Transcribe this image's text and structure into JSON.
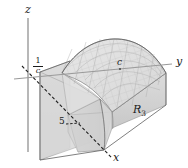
{
  "figure": {
    "type": "3d-math-diagram",
    "background_color": "#ffffff"
  },
  "axes": {
    "z_label": "z",
    "y_label": "y",
    "x_label": "x",
    "axis_color": "#8c8c8c",
    "dashed_axis_color": "#1a1a1a"
  },
  "marks": {
    "z_intercept_numerator": "1",
    "z_intercept_denominator": "c",
    "y_mark": "c",
    "x_mark": "5"
  },
  "region": {
    "label_text": "R",
    "label_subscript": "3"
  },
  "colors": {
    "surface_fill": "#dcdcdc",
    "surface_fill_light": "#e8e8e8",
    "side_panel_fill": "#d2d2d2",
    "front_panel_fill": "#cfcfcf",
    "mesh_line": "#a8a8a8",
    "outline": "#6e6e6e",
    "text": "#1a1a1a"
  }
}
